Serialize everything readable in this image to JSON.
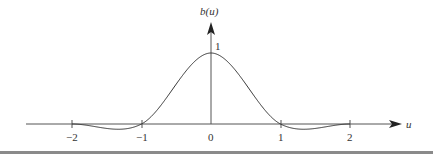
{
  "chart_data": {
    "type": "line",
    "title": "",
    "xlabel": "u",
    "ylabel": "b(u)",
    "xlim": [
      -2.6,
      2.7
    ],
    "ylim": [
      -0.15,
      1.4
    ],
    "grid": false,
    "legend": null,
    "x_ticks": [
      -2,
      -1,
      0,
      1,
      2
    ],
    "x_tick_labels": [
      "−2",
      "−1",
      "0",
      "1",
      "2"
    ],
    "y_tick_labels": [
      "1"
    ],
    "annotations": [
      {
        "text": "1",
        "x": 0,
        "y": 1
      }
    ],
    "series": [
      {
        "name": "b(u)",
        "description": "cubic interpolation kernel",
        "x": [
          -2,
          -1.75,
          -1.5,
          -1.25,
          -1,
          -0.75,
          -0.5,
          -0.25,
          0,
          0.25,
          0.5,
          0.75,
          1,
          1.25,
          1.5,
          1.75,
          2
        ],
        "values": [
          0,
          -0.04,
          -0.08,
          -0.06,
          0,
          0.23,
          0.56,
          0.87,
          1,
          0.87,
          0.56,
          0.23,
          0,
          -0.06,
          -0.08,
          -0.04,
          0
        ]
      }
    ]
  },
  "labels": {
    "y_axis": "b(u)",
    "x_axis": "u",
    "peak": "1",
    "ticks": [
      "−2",
      "−1",
      "0",
      "1",
      "2"
    ]
  },
  "colors": {
    "axis": "#555555",
    "curve": "#333333",
    "rule": "#8a8a8a"
  }
}
